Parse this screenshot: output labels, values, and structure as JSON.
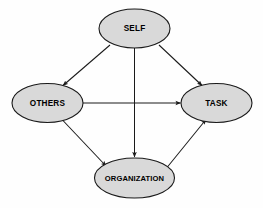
{
  "diagram": {
    "type": "directed-graph",
    "background_color": "#fefefe",
    "node_fill_color": "#d9d9d9",
    "node_stroke_color": "#1a1a1a",
    "edge_color": "#1a1a1a",
    "nodes": [
      {
        "id": "self",
        "label": "SELF",
        "shape": "ellipse",
        "cx": 134.5,
        "cy": 28.5,
        "rx": 35.5,
        "ry": 19.5
      },
      {
        "id": "others",
        "label": "OTHERS",
        "shape": "ellipse",
        "cx": 47.5,
        "cy": 103.0,
        "rx": 35.5,
        "ry": 19.5
      },
      {
        "id": "task",
        "label": "TASK",
        "shape": "ellipse",
        "cx": 216.5,
        "cy": 103.0,
        "rx": 35.5,
        "ry": 19.5
      },
      {
        "id": "organization",
        "label": "ORGANIZATION",
        "shape": "ellipse",
        "cx": 134.5,
        "cy": 178.0,
        "rx": 40.0,
        "ry": 20.0
      }
    ],
    "edges": [
      {
        "id": "self-to-others",
        "from": "SELF",
        "to": "OTHERS",
        "arrowhead": "filled-triangle",
        "x1": 110.0,
        "y1": 45.0,
        "x2": 62.0,
        "y2": 86.5
      },
      {
        "id": "self-to-task",
        "from": "SELF",
        "to": "TASK",
        "arrowhead": "filled-triangle",
        "x1": 159.0,
        "y1": 45.0,
        "x2": 203.0,
        "y2": 86.5
      },
      {
        "id": "self-to-organization",
        "from": "SELF",
        "to": "ORGANIZATION",
        "arrowhead": "filled-triangle",
        "x1": 134.5,
        "y1": 48.0,
        "x2": 134.5,
        "y2": 157.0
      },
      {
        "id": "others-to-task",
        "from": "OTHERS",
        "to": "TASK",
        "arrowhead": "filled-triangle",
        "x1": 83.0,
        "y1": 103.0,
        "x2": 180.0,
        "y2": 103.0
      },
      {
        "id": "others-to-organization",
        "from": "OTHERS",
        "to": "ORGANIZATION",
        "arrowhead": "filled-triangle",
        "x1": 62.0,
        "y1": 119.5,
        "x2": 105.0,
        "y2": 165.5
      },
      {
        "id": "organization-to-task",
        "from": "ORGANIZATION",
        "to": "TASK",
        "arrowhead": "filled-triangle",
        "x1": 167.0,
        "y1": 167.0,
        "x2": 205.0,
        "y2": 120.0
      }
    ]
  }
}
